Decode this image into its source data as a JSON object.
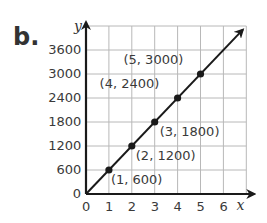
{
  "part_label": "b.",
  "chart_data": {
    "type": "line",
    "title": "",
    "xlabel": "x",
    "ylabel": "y",
    "xlim": [
      0,
      7
    ],
    "ylim": [
      0,
      4200
    ],
    "grid": true,
    "x_ticks": [
      0,
      1,
      2,
      3,
      4,
      5,
      6
    ],
    "y_ticks": [
      0,
      600,
      1200,
      1800,
      2400,
      3000,
      3600
    ],
    "x_tick_labels": [
      "0",
      "1",
      "2",
      "3",
      "4",
      "5",
      "6"
    ],
    "y_tick_labels": [
      "0",
      "600",
      "1200",
      "1800",
      "2400",
      "3000",
      "3600"
    ],
    "series": [
      {
        "name": "y = 600x",
        "x": [
          0,
          1,
          2,
          3,
          4,
          5
        ],
        "y": [
          0,
          600,
          1200,
          1800,
          2400,
          3000
        ],
        "line_extends_with_arrow": true
      }
    ],
    "points": [
      {
        "x": 1,
        "y": 600,
        "label": "(1, 600)"
      },
      {
        "x": 2,
        "y": 1200,
        "label": "(2, 1200)"
      },
      {
        "x": 3,
        "y": 1800,
        "label": "(3, 1800)"
      },
      {
        "x": 4,
        "y": 2400,
        "label": "(4, 2400)"
      },
      {
        "x": 5,
        "y": 3000,
        "label": "(5, 3000)"
      }
    ],
    "colors": {
      "line": "#1a1a1a",
      "grid": "#b8b8b8",
      "text": "#3a3a3a"
    }
  }
}
